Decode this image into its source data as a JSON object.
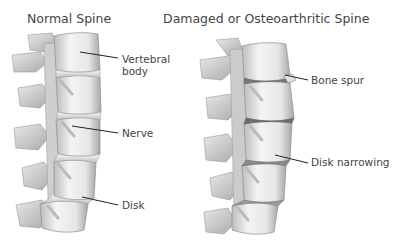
{
  "diagram": {
    "left_panel": {
      "title": "Normal Spine",
      "labels": {
        "vertebral_body_line1": "Vertebral",
        "vertebral_body_line2": "body",
        "nerve": "Nerve",
        "disk": "Disk"
      }
    },
    "right_panel": {
      "title": "Damaged or Osteoarthritic Spine",
      "labels": {
        "bone_spur": "Bone spur",
        "disk_narrowing": "Disk narrowing"
      }
    },
    "colors": {
      "bone_light": "#f2f2f2",
      "bone_mid": "#d6d6d6",
      "bone_dark": "#9a9a9a",
      "leader_line": "#222222",
      "text": "#444444"
    }
  }
}
